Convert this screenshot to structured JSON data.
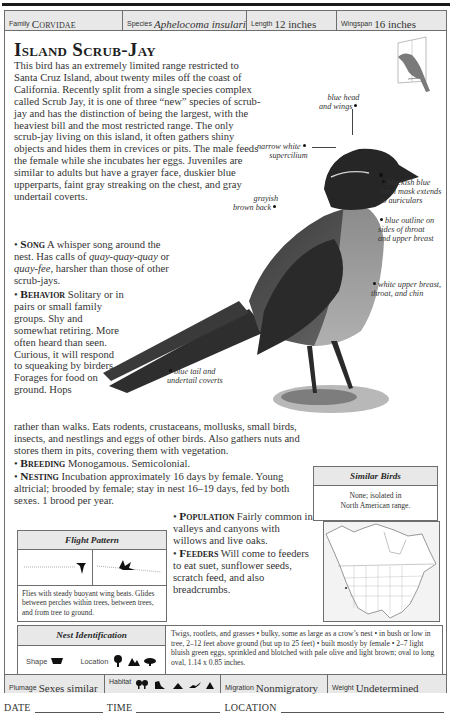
{
  "header": {
    "family_label": "Family",
    "family_value": "Corvidae",
    "species_label": "Species",
    "species_value": "Aphelocoma insularis",
    "length_label": "Length",
    "length_value": "12 inches",
    "wingspan_label": "Wingspan",
    "wingspan_value": "16 inches"
  },
  "title": "Island Scrub-Jay",
  "intro": "This bird has an extremely limited range restricted to Santa Cruz Island, about twenty miles off the coast of California. Recently split from a single species complex called Scrub Jay, it is one of three “new” species of scrub-jay and has the distinction of being the largest, with the heaviest bill and the most restricted range. The only scrub-jay living on this island, it often gathers shiny objects and hides them in crevices or pits. The male feeds the female while she incubates her eggs. Juveniles are similar to adults but have a grayer face, duskier blue upperparts, faint gray streaking on the chest, and gray undertail coverts.",
  "sections": {
    "song_kw": "Song",
    "song_a": "A whisper song around the nest. Has calls of",
    "song_call1": "quay-quay-quay",
    "song_or": "or",
    "song_call2": "quay-fee",
    "song_b": ", harsher than those of other scrub-jays.",
    "behavior_kw": "Behavior",
    "behavior_text": "Solitary or in pairs or small family groups. Shy and somewhat retiring. More often heard than seen. Curious, it will respond to squeaking by birders. Forages for food on ground. Hops",
    "behavior_text2": "rather than walks. Eats rodents, crustaceans, mollusks, small birds, insects, and nestlings and eggs of other birds. Also gathers nuts and stores them in pits, covering them with vegetation.",
    "breeding_kw": "Breeding",
    "breeding_text": "Monogamous. Semicolonial.",
    "nesting_kw": "Nesting",
    "nesting_text": "Incubation approximately 16 days by female. Young altricial; brooded by female; stay in nest 16–19 days, fed by both sexes. 1 brood per year.",
    "population_kw": "Population",
    "population_text": "Fairly common in valleys and canyons with willows and live oaks.",
    "feeders_kw": "Feeders",
    "feeders_text": "Will come to feeders to eat suet, sunflower seeds, scratch feed, and also breadcrumbs."
  },
  "callouts": {
    "head": [
      "blue head",
      "and wings"
    ],
    "supercilium": [
      "narrow white",
      "supercilium"
    ],
    "mask": [
      "blackish blue",
      "loral mask extends",
      "to auriculars"
    ],
    "back": [
      "grayish",
      "brown back"
    ],
    "outline": [
      "blue outline on",
      "sides of throat",
      "and upper breast"
    ],
    "breast": [
      "white upper breast,",
      "throat, and chin"
    ],
    "tail": [
      "blue tail and",
      "undertail coverts"
    ]
  },
  "similar_birds": {
    "title": "Similar Birds",
    "text_line1": "None; isolated in",
    "text_line2": "North American range."
  },
  "flight_pattern": {
    "title": "Flight Pattern",
    "description": "Flies with steady buoyant wing beats. Glides between perches within trees, between trees, and from tree to ground."
  },
  "nest_identification": {
    "title": "Nest Identification",
    "shape_label": "Shape",
    "location_label": "Location",
    "description": "Twigs, rootlets, and grasses • bulky, some as large as a crow’s nest • in bush or low in tree, 2–12 feet above ground (but up to 25 feet) • built mostly by female • 2–7 light bluish green eggs, sprinkled and blotched with pale olive and light brown; oval to long oval, 1.14 x 0.85 inches."
  },
  "footer": {
    "plumage_label": "Plumage",
    "plumage_value": "Sexes similar",
    "habitat_label": "Habitat",
    "habitat_icons": [
      "forest-icon",
      "shrub-icon",
      "hill-icon",
      "wetland-icon",
      "mountain-icon"
    ],
    "migration_label": "Migration",
    "migration_value": "Nonmigratory",
    "weight_label": "Weight",
    "weight_value": "Undetermined"
  },
  "log": {
    "date_label": "DATE",
    "time_label": "TIME",
    "location_label": "LOCATION"
  },
  "colors": {
    "header_bg": "#e8e8e8",
    "border": "#6e6e6e",
    "text": "#333333"
  }
}
